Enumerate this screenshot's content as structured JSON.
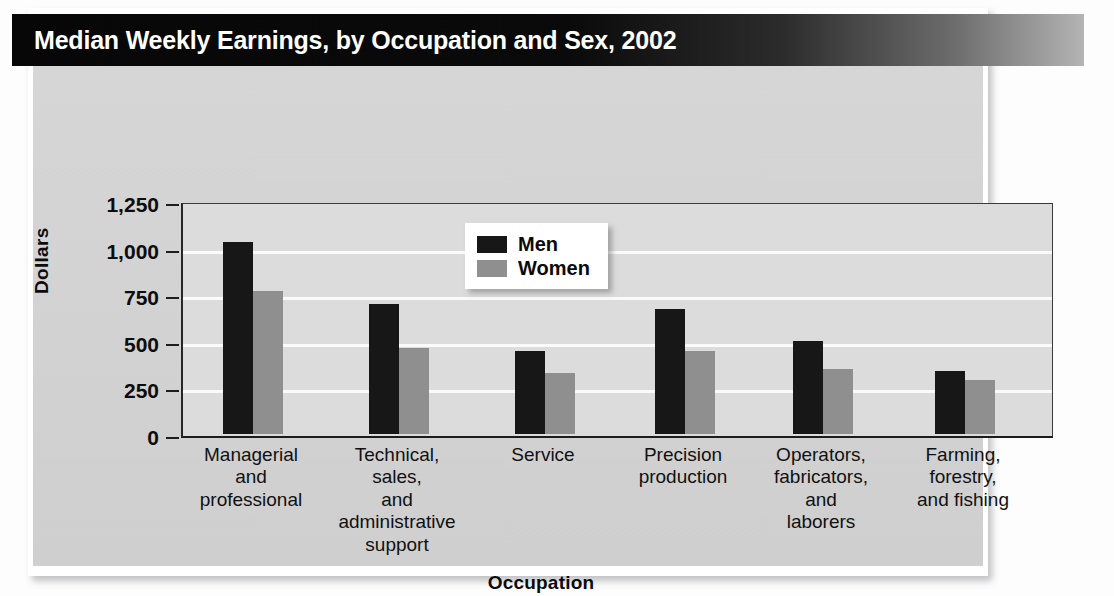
{
  "figure": {
    "title": "Median Weekly Earnings, by Occupation and Sex, 2002",
    "source_note": "Source:  Bureau of Labor Statistics"
  },
  "chart_data": {
    "type": "bar",
    "title": "Median Weekly Earnings, by Occupation and Sex, 2002",
    "xlabel": "Occupation",
    "ylabel": "Dollars",
    "ylim": [
      0,
      1250
    ],
    "yticks": [
      0,
      250,
      500,
      750,
      1000,
      1250
    ],
    "ytick_labels": [
      "0",
      "250",
      "500",
      "750",
      "1,000",
      "1,250"
    ],
    "grid": true,
    "legend_position": "upper center",
    "categories": [
      "Managerial\nand\nprofessional",
      "Technical,\nsales,\nand\nadministrative\nsupport",
      "Service",
      "Precision\nproduction",
      "Operators,\nfabricators,\nand\nlaborers",
      "Farming,\nforestry,\nand fishing"
    ],
    "category_lines": [
      [
        "Managerial",
        "and",
        "professional"
      ],
      [
        "Technical,",
        "sales,",
        "and",
        "administrative",
        "support"
      ],
      [
        "Service"
      ],
      [
        "Precision",
        "production"
      ],
      [
        "Operators,",
        "fabricators,",
        "and",
        "laborers"
      ],
      [
        "Farming,",
        "forestry,",
        "and fishing"
      ]
    ],
    "series": [
      {
        "name": "Men",
        "color": "#171717",
        "values": [
          1030,
          695,
          445,
          670,
          500,
          340
        ]
      },
      {
        "name": "Women",
        "color": "#8f8f8f",
        "values": [
          765,
          460,
          325,
          445,
          350,
          290
        ]
      }
    ]
  },
  "legend": {
    "items": [
      {
        "label": "Men",
        "color": "#171717"
      },
      {
        "label": "Women",
        "color": "#8f8f8f"
      }
    ]
  }
}
